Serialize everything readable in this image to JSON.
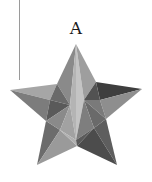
{
  "figure": {
    "label": "A",
    "shape": "faceted-star-icon",
    "colors": {
      "light": "#c8c8c8",
      "mid_light": "#a8a8a8",
      "mid": "#8c8c8c",
      "mid_dark": "#6e6e6e",
      "dark": "#4a4a4a",
      "line": "#9a9a9a"
    }
  }
}
